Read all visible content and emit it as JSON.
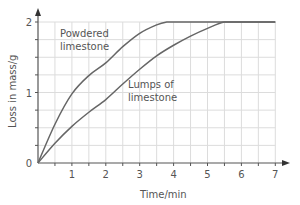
{
  "chart_data": {
    "type": "line",
    "title": "",
    "xlabel": "Time/min",
    "ylabel": "Loss in mass/g",
    "xlim": [
      0,
      7
    ],
    "ylim": [
      0,
      2
    ],
    "x_ticks": [
      "1",
      "2",
      "3",
      "4",
      "5",
      "6",
      "7"
    ],
    "y_ticks": [
      "0",
      "1",
      "2"
    ],
    "grid": true,
    "grid_x_step": 0.5,
    "grid_y_step": 0.25,
    "legend": "none (curves labeled directly)",
    "series": [
      {
        "name": "Powdered limestone",
        "label_lines": [
          "Powdered",
          "limestone"
        ],
        "color": "#666666",
        "x": [
          0,
          0.5,
          1,
          1.5,
          2,
          2.5,
          3,
          3.5,
          3.8,
          4,
          5,
          6,
          7
        ],
        "y": [
          0,
          0.55,
          0.98,
          1.24,
          1.42,
          1.65,
          1.84,
          1.96,
          2.0,
          2.0,
          2.0,
          2.0,
          2.0
        ]
      },
      {
        "name": "Lumps of limestone",
        "label_lines": [
          "Lumps of",
          "limestone"
        ],
        "color": "#666666",
        "x": [
          0,
          0.5,
          1,
          1.5,
          2,
          2.5,
          3,
          3.5,
          4,
          4.5,
          5,
          5.5,
          6,
          7
        ],
        "y": [
          0,
          0.28,
          0.52,
          0.72,
          0.9,
          1.12,
          1.33,
          1.52,
          1.67,
          1.8,
          1.91,
          2.0,
          2.0,
          2.0
        ]
      }
    ]
  }
}
